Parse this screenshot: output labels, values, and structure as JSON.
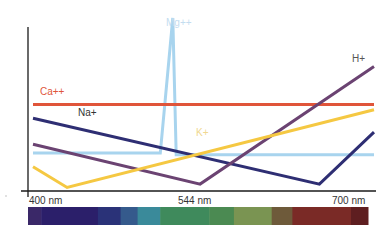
{
  "chart_data": {
    "type": "line",
    "title": "",
    "xlabel": "Wavelength",
    "ylabel": "",
    "x_ticks": [
      "400 nm",
      "544 nm",
      "700 nm"
    ],
    "xlim": [
      400,
      700
    ],
    "grid": false,
    "legend": "inline labels",
    "series": [
      {
        "name": "Mg++",
        "color": "#a8d4ee",
        "points": [
          [
            400,
            0.22
          ],
          [
            512,
            0.22
          ],
          [
            523,
            1.0
          ],
          [
            526,
            0.21
          ],
          [
            700,
            0.21
          ]
        ],
        "label_pos": [
          166,
          26
        ]
      },
      {
        "name": "Ca++",
        "color": "#e0553a",
        "points": [
          [
            400,
            0.5
          ],
          [
            700,
            0.5
          ]
        ],
        "label_pos": [
          40,
          95
        ]
      },
      {
        "name": "Na+",
        "color": "#2e2e73",
        "points": [
          [
            400,
            0.42
          ],
          [
            652,
            0.04
          ],
          [
            700,
            0.34
          ]
        ],
        "label_pos": [
          78,
          116
        ]
      },
      {
        "name": "H+",
        "color": "#6b4372",
        "points": [
          [
            400,
            0.27
          ],
          [
            547,
            0.04
          ],
          [
            700,
            0.72
          ]
        ],
        "label_pos": [
          352,
          62
        ]
      },
      {
        "name": "K+",
        "color": "#f5c842",
        "points": [
          [
            400,
            0.14
          ],
          [
            430,
            0.02
          ],
          [
            700,
            0.47
          ]
        ],
        "label_pos": [
          196,
          136
        ]
      }
    ],
    "spectrum_bar": [
      {
        "color": "#3a2868",
        "w": 14
      },
      {
        "color": "#2b1f6a",
        "w": 60
      },
      {
        "color": "#2a3278",
        "w": 24
      },
      {
        "color": "#355a8c",
        "w": 18
      },
      {
        "color": "#3a8a9a",
        "w": 24
      },
      {
        "color": "#3f8a5c",
        "w": 52
      },
      {
        "color": "#4b8a52",
        "w": 26
      },
      {
        "color": "#7a9452",
        "w": 40
      },
      {
        "color": "#6e5a3a",
        "w": 22
      },
      {
        "color": "#7a2a26",
        "w": 62
      },
      {
        "color": "#5e1e20",
        "w": 18
      }
    ]
  },
  "axis": {
    "color": "#1a1a1a",
    "label_color": "#333333"
  }
}
